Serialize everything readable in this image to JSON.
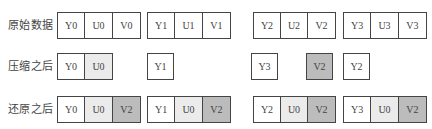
{
  "rows": {
    "original": {
      "label": "原始数据",
      "groups": [
        {
          "cells": [
            {
              "text": "Y0",
              "shade": "none"
            },
            {
              "text": "U0",
              "shade": "none"
            },
            {
              "text": "V0",
              "shade": "none"
            }
          ]
        },
        {
          "cells": [
            {
              "text": "Y1",
              "shade": "none"
            },
            {
              "text": "U1",
              "shade": "none"
            },
            {
              "text": "V1",
              "shade": "none"
            }
          ]
        },
        {
          "cells": [
            {
              "text": "Y2",
              "shade": "none"
            },
            {
              "text": "U2",
              "shade": "none"
            },
            {
              "text": "V2",
              "shade": "none"
            }
          ]
        },
        {
          "cells": [
            {
              "text": "Y3",
              "shade": "none"
            },
            {
              "text": "U3",
              "shade": "none"
            },
            {
              "text": "V3",
              "shade": "none"
            }
          ]
        }
      ]
    },
    "compressed": {
      "label": "压缩之后",
      "items": [
        {
          "cells": [
            {
              "text": "Y0",
              "shade": "none"
            },
            {
              "text": "U0",
              "shade": "light"
            }
          ]
        },
        {
          "text": "Y1",
          "shade": "none"
        },
        {
          "text": "Y3",
          "shade": "none"
        },
        {
          "text": "V2",
          "shade": "dark"
        },
        {
          "text": "Y2",
          "shade": "none"
        }
      ]
    },
    "restored": {
      "label": "还原之后",
      "groups": [
        {
          "cells": [
            {
              "text": "Y0",
              "shade": "none"
            },
            {
              "text": "U0",
              "shade": "light"
            },
            {
              "text": "V2",
              "shade": "dark"
            }
          ]
        },
        {
          "cells": [
            {
              "text": "Y1",
              "shade": "none"
            },
            {
              "text": "U0",
              "shade": "light"
            },
            {
              "text": "V2",
              "shade": "dark"
            }
          ]
        },
        {
          "cells": [
            {
              "text": "Y2",
              "shade": "none"
            },
            {
              "text": "U0",
              "shade": "light"
            },
            {
              "text": "V2",
              "shade": "dark"
            }
          ]
        },
        {
          "cells": [
            {
              "text": "Y3",
              "shade": "none"
            },
            {
              "text": "U0",
              "shade": "light"
            },
            {
              "text": "V2",
              "shade": "dark"
            }
          ]
        }
      ]
    }
  },
  "colors": {
    "border": "#444444",
    "light_shade": "#ebebeb",
    "dark_shade": "#bcbcbc"
  }
}
